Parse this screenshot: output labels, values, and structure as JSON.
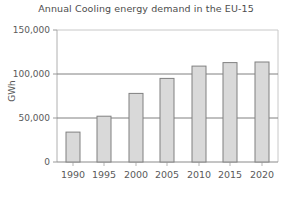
{
  "chart_data": {
    "type": "bar",
    "title": "Annual Cooling energy demand in the EU-15",
    "xlabel": "",
    "ylabel": "GWh",
    "categories": [
      "1990",
      "1995",
      "2000",
      "2005",
      "2010",
      "2015",
      "2020"
    ],
    "values": [
      23000,
      34000,
      52000,
      78000,
      95000,
      109000,
      113000
    ],
    "ylim": [
      0,
      150000
    ],
    "yticks": [
      0,
      50000,
      100000,
      150000
    ],
    "ytick_labels": [
      "0",
      "50,000",
      "100,000",
      "150,000"
    ],
    "grid": true,
    "legend": false,
    "bar_fill": "#d9d9d9",
    "bar_edge": "#808080",
    "gridline_color": "#808080",
    "frame_color": "#c8c8c8",
    "text_color": "#5a5a5a"
  }
}
